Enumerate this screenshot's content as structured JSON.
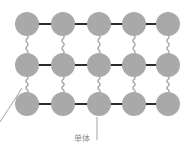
{
  "diagram": {
    "rows": 3,
    "columns": 5,
    "node_color": "#a9a9a9",
    "bond_color": "#2b2b2b",
    "crosslink_color": "#a0a0a0",
    "leader_color": "#7a7a7a",
    "horizontal_bond_type": "covalent bond (solid line)",
    "vertical_link_type": "wavy crosslink",
    "labels": {
      "monomer": "单体",
      "left_fragment": ""
    }
  }
}
